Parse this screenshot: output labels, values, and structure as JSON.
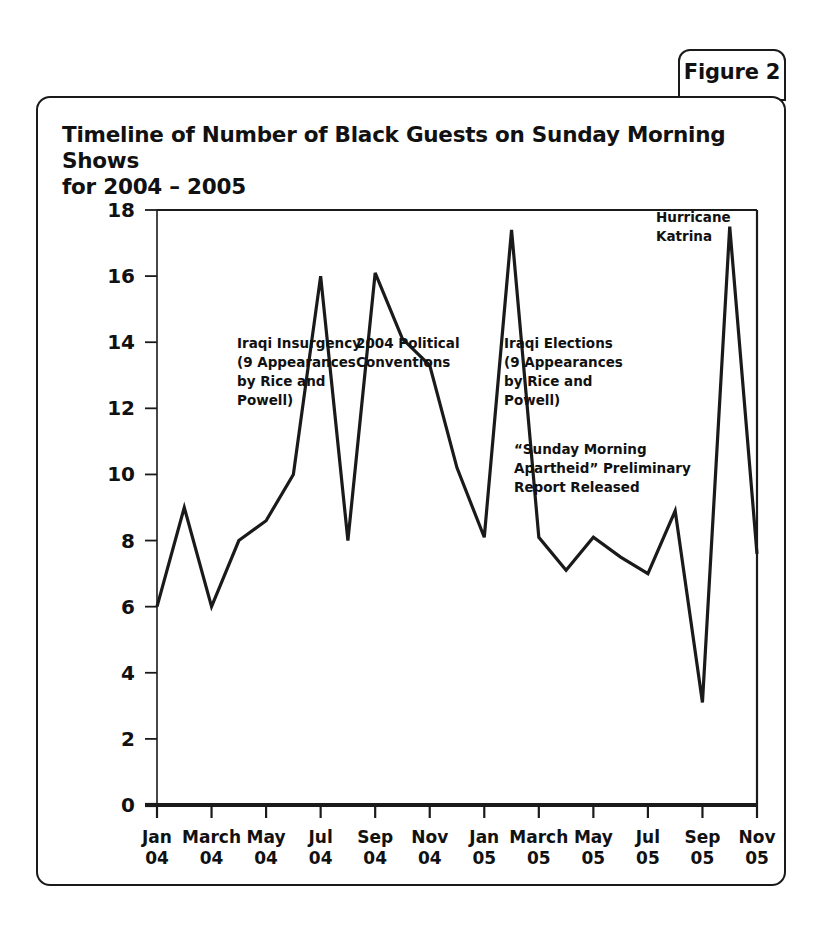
{
  "figure_tab": {
    "label": "Figure 2"
  },
  "chart_title_line1": "Timeline of Number of Black Guests on Sunday Morning Shows",
  "chart_title_line2": "for 2004 – 2005",
  "chart_data": {
    "type": "line",
    "title": "Timeline of Number of Black Guests on Sunday Morning Shows for 2004 – 2005",
    "xlabel": "",
    "ylabel": "",
    "grid": false,
    "legend": "none",
    "ylim": [
      0,
      18
    ],
    "yticks": [
      0,
      2,
      4,
      6,
      8,
      10,
      12,
      14,
      16,
      18
    ],
    "ytick_labels": [
      "0",
      "2",
      "4",
      "6",
      "8",
      "10",
      "12",
      "14",
      "16",
      "18"
    ],
    "xtick_labels": [
      "Jan\n04",
      "March\n04",
      "May\n04",
      "Jul\n04",
      "Sep\n04",
      "Nov\n04",
      "Jan\n05",
      "March\n05",
      "May\n05",
      "Jul\n05",
      "Sep\n05",
      "Nov\n05"
    ],
    "xtick_months": [
      "Jan 04",
      "March 04",
      "May 04",
      "Jul 04",
      "Sep 04",
      "Nov 04",
      "Jan 05",
      "March 05",
      "May 05",
      "Jul 05",
      "Sep 05",
      "Nov 05"
    ],
    "x": [
      "Jan 04",
      "Feb 04",
      "Mar 04",
      "Apr 04",
      "May 04",
      "Jun 04",
      "Jul 04",
      "Aug 04",
      "Sep 04",
      "Oct 04",
      "Nov 04",
      "Dec 04",
      "Jan 05",
      "Feb 05",
      "Mar 05",
      "Apr 05",
      "May 05",
      "Jun 05",
      "Jul 05",
      "Aug 05",
      "Sep 05",
      "Oct 05",
      "Nov 05"
    ],
    "values": [
      6.0,
      9.0,
      6.0,
      8.0,
      8.6,
      10.0,
      16.0,
      8.0,
      16.1,
      14.1,
      13.3,
      10.2,
      8.1,
      17.4,
      8.1,
      7.1,
      8.1,
      7.5,
      7.0,
      8.9,
      3.1,
      17.5,
      7.6
    ],
    "annotations": [
      {
        "name": "iraqi-insurgency",
        "text": "Iraqi Insurgency\n(9 Appearances\nby Rice and\nPowell)",
        "near_month": "Jun 04"
      },
      {
        "name": "political-conventions",
        "text": "2004 Political\nConventions",
        "near_month": "Sep 04"
      },
      {
        "name": "iraqi-elections",
        "text": "Iraqi Elections\n(9 Appearances\nby Rice and\nPowell)",
        "near_month": "Feb 05"
      },
      {
        "name": "sma-report",
        "text": "“Sunday Morning\nApartheid” Preliminary\nReport Released",
        "near_month": "Jun 05"
      },
      {
        "name": "hurricane-katrina",
        "text": "Hurricane\nKatrina",
        "near_month": "Oct 05"
      }
    ]
  },
  "annotation_lines": {
    "iraqi_insurgency": [
      "Iraqi Insurgency",
      "(9 Appearances",
      "by Rice and",
      "Powell)"
    ],
    "political_conventions": [
      "2004 Political",
      "Conventions"
    ],
    "iraqi_elections": [
      "Iraqi Elections",
      "(9 Appearances",
      "by Rice and",
      "Powell)"
    ],
    "sma_report": [
      "“Sunday Morning",
      "Apartheid” Preliminary",
      "Report Released"
    ],
    "hurricane_katrina": [
      "Hurricane",
      "Katrina"
    ]
  },
  "colors": {
    "line": "#1a1a1a",
    "axis": "#1a1a1a",
    "background": "#ffffff",
    "text": "#111111"
  }
}
